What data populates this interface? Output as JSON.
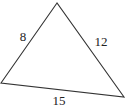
{
  "diagram": {
    "type": "triangle",
    "stroke_color": "#333333",
    "vertices": {
      "top": [
        57,
        3
      ],
      "left": [
        1,
        83
      ],
      "right": [
        124,
        97
      ]
    },
    "sides": [
      {
        "name": "left-side",
        "label": "8",
        "label_pos": [
          23,
          41
        ]
      },
      {
        "name": "right-side",
        "label": "12",
        "label_pos": [
          101,
          46
        ]
      },
      {
        "name": "bottom-side",
        "label": "15",
        "label_pos": [
          59,
          105
        ]
      }
    ]
  }
}
